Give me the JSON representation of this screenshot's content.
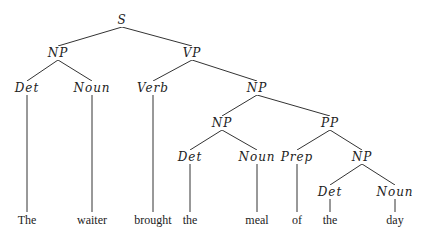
{
  "diagram": {
    "type": "parse-tree",
    "line_color": "#333333",
    "nodes": [
      {
        "id": "S",
        "label": "S",
        "x": 122,
        "y": 20
      },
      {
        "id": "NP1",
        "label": "NP",
        "x": 58,
        "y": 53,
        "parent": "S"
      },
      {
        "id": "VP",
        "label": "VP",
        "x": 192,
        "y": 53,
        "parent": "S"
      },
      {
        "id": "Det1",
        "label": "Det",
        "x": 27,
        "y": 88,
        "parent": "NP1"
      },
      {
        "id": "Noun1",
        "label": "Noun",
        "x": 92,
        "y": 88,
        "parent": "NP1"
      },
      {
        "id": "Verb",
        "label": "Verb",
        "x": 153,
        "y": 88,
        "parent": "VP"
      },
      {
        "id": "NP2",
        "label": "NP",
        "x": 257,
        "y": 88,
        "parent": "VP"
      },
      {
        "id": "NP3",
        "label": "NP",
        "x": 222,
        "y": 123,
        "parent": "NP2"
      },
      {
        "id": "PP",
        "label": "PP",
        "x": 330,
        "y": 123,
        "parent": "NP2"
      },
      {
        "id": "Det2",
        "label": "Det",
        "x": 190,
        "y": 157,
        "parent": "NP3"
      },
      {
        "id": "Noun2",
        "label": "Noun",
        "x": 257,
        "y": 157,
        "parent": "NP3"
      },
      {
        "id": "Prep",
        "label": "Prep",
        "x": 297,
        "y": 157,
        "parent": "PP"
      },
      {
        "id": "NP4",
        "label": "NP",
        "x": 362,
        "y": 157,
        "parent": "PP"
      },
      {
        "id": "Det3",
        "label": "Det",
        "x": 330,
        "y": 192,
        "parent": "NP4"
      },
      {
        "id": "Noun3",
        "label": "Noun",
        "x": 395,
        "y": 192,
        "parent": "NP4"
      }
    ],
    "words": [
      {
        "text": "The",
        "x": 27,
        "y": 220,
        "parent": "Det1"
      },
      {
        "text": "waiter",
        "x": 92,
        "y": 220,
        "parent": "Noun1"
      },
      {
        "text": "brought",
        "x": 153,
        "y": 220,
        "parent": "Verb"
      },
      {
        "text": "the",
        "x": 190,
        "y": 220,
        "parent": "Det2"
      },
      {
        "text": "meal",
        "x": 257,
        "y": 220,
        "parent": "Noun2"
      },
      {
        "text": "of",
        "x": 297,
        "y": 220,
        "parent": "Prep"
      },
      {
        "text": "the",
        "x": 330,
        "y": 220,
        "parent": "Det3"
      },
      {
        "text": "day",
        "x": 395,
        "y": 220,
        "parent": "Noun3"
      }
    ]
  }
}
